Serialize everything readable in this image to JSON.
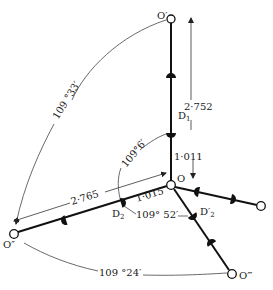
{
  "figure": {
    "type": "tetrahedral hydrogen-bond geometry (ice-like O–D···O)",
    "atoms": {
      "central": "O",
      "top": "O′",
      "left": "O″",
      "bottom": "O‴",
      "right": ""
    },
    "deuterium_labels": {
      "d1": "D",
      "d1_sub": "1",
      "d2": "D",
      "d2_sub": "2",
      "d2_prime": "D′",
      "d2_prime_sub": "2"
    },
    "distances": {
      "o_to_o_prime": "2·752",
      "o_to_d1": "1·011",
      "o_to_o_double_prime": "2·765",
      "o_to_d2": "1·015"
    },
    "angles": {
      "o_prime_o_o_double_prime": "109 °33′",
      "d1_o_d2": "109°6′",
      "d2_o_d2_prime": "109° 52′",
      "o_double_prime_o_o_triple_prime": "109 °24′"
    },
    "colors": {
      "ink": "#111111",
      "background": "#ffffff"
    }
  }
}
